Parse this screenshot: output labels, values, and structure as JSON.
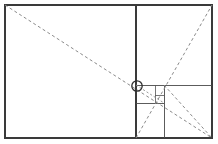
{
  "figure": {
    "background_color": "#ffffff",
    "line_color": "#3a3a3a",
    "dashed_color": "#8a8a8a",
    "marker_color": "#2e2e2e",
    "width": 218,
    "height": 144
  },
  "chart_data": {
    "type": "diagram",
    "xlabel": "",
    "ylabel": "",
    "xlim": [
      0,
      218
    ],
    "ylim": [
      0,
      144
    ],
    "grid": false,
    "legend": "none",
    "outer_rectangle": {
      "name": "outer-rectangle",
      "x": 5,
      "y": 5,
      "width": 207,
      "height": 133
    },
    "subdivisions": [
      {
        "name": "major-vertical-divider",
        "orientation": "vertical",
        "x": 136,
        "y1": 5,
        "y2": 138
      },
      {
        "name": "square-horizontal-divider",
        "orientation": "horizontal",
        "y": 85,
        "x1": 136,
        "x2": 212
      },
      {
        "name": "inner-vertical-divider",
        "orientation": "vertical",
        "x": 164,
        "y1": 85,
        "y2": 138
      },
      {
        "name": "inner-horizontal-divider",
        "orientation": "horizontal",
        "y": 103,
        "x1": 136,
        "x2": 164
      },
      {
        "name": "small-square-vertical",
        "orientation": "vertical",
        "x": 155,
        "y1": 85,
        "y2": 103
      },
      {
        "name": "tiny-square-horizontal",
        "orientation": "horizontal",
        "y": 95,
        "x1": 155,
        "x2": 164
      }
    ],
    "diagonals": [
      {
        "name": "primary-diagonal",
        "style": "dashed",
        "x1": 5,
        "y1": 5,
        "x2": 212,
        "y2": 138
      },
      {
        "name": "reciprocal-diagonal",
        "style": "dashed",
        "x1": 136,
        "y1": 138,
        "x2": 212,
        "y2": 5
      },
      {
        "name": "inner-square-diagonal",
        "style": "dashed",
        "x1": 136,
        "y1": 85,
        "x2": 164,
        "y2": 103
      },
      {
        "name": "lower-right-diagonal",
        "style": "dashed",
        "x1": 164,
        "y1": 85,
        "x2": 212,
        "y2": 138
      }
    ],
    "markers": [
      {
        "name": "eye-of-rectangle",
        "shape": "circle",
        "cx": 137,
        "cy": 86,
        "r": 5.2,
        "label": ""
      }
    ],
    "annotations": []
  }
}
